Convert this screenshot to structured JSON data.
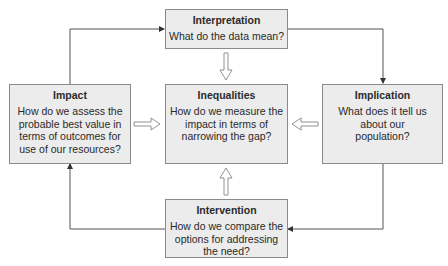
{
  "diagram": {
    "type": "cycle-flowchart",
    "colors": {
      "box_fill": "#ececec",
      "box_border": "#8a8a8a",
      "line": "#555555",
      "text": "#2a2a2a"
    },
    "nodes": {
      "interpretation": {
        "title": "Interpretation",
        "body": "What do the data mean?"
      },
      "implication": {
        "title": "Implication",
        "body": "What does it tell us about our population?"
      },
      "intervention": {
        "title": "Intervention",
        "body": "How do we compare the options for addressing the need?"
      },
      "impact": {
        "title": "Impact",
        "body": "How do we assess the probable best value in terms of outcomes for use of our resources?"
      },
      "inequalities": {
        "title": "Inequalities",
        "body": "How do we measure the impact in terms of narrowing the gap?"
      }
    },
    "edges": [
      {
        "from": "impact",
        "to": "interpretation",
        "style": "line-arrow"
      },
      {
        "from": "interpretation",
        "to": "implication",
        "style": "line-arrow"
      },
      {
        "from": "implication",
        "to": "intervention",
        "style": "line-arrow"
      },
      {
        "from": "intervention",
        "to": "impact",
        "style": "line-arrow"
      },
      {
        "from": "interpretation",
        "to": "inequalities",
        "style": "hollow-block-arrow"
      },
      {
        "from": "implication",
        "to": "inequalities",
        "style": "hollow-block-arrow"
      },
      {
        "from": "intervention",
        "to": "inequalities",
        "style": "hollow-block-arrow"
      },
      {
        "from": "impact",
        "to": "inequalities",
        "style": "hollow-block-arrow"
      }
    ]
  }
}
